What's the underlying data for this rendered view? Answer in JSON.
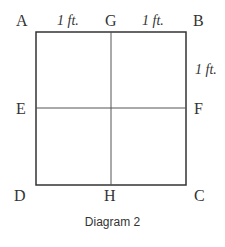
{
  "diagram": {
    "points": {
      "A": "A",
      "G": "G",
      "B": "B",
      "E": "E",
      "F": "F",
      "D": "D",
      "H": "H",
      "C": "C"
    },
    "dimensions": {
      "top_left": "1 ft.",
      "top_right": "1 ft.",
      "right_upper": "1 ft."
    },
    "caption": "Diagram 2",
    "colors": {
      "line": "#333333",
      "background": "#ffffff"
    }
  }
}
